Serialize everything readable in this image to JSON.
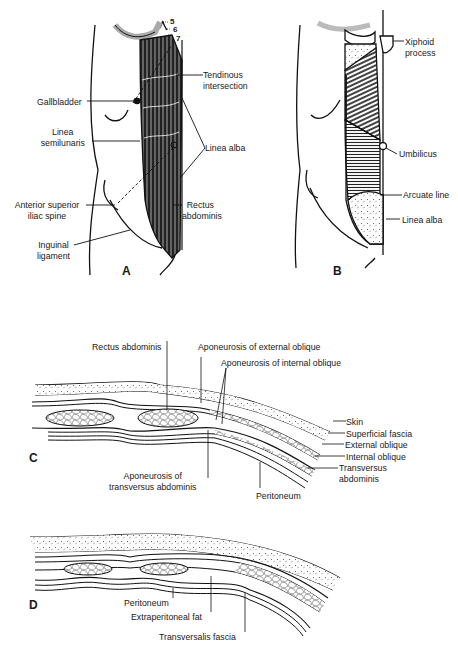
{
  "figure": {
    "panels": {
      "A": {
        "letter": "A",
        "rib_numbers": [
          "5",
          "6",
          "7"
        ],
        "labels": {
          "tendinous_intersection": [
            "Tendinous",
            "intersection"
          ],
          "gallbladder": "Gallbladder",
          "linea_semilunaris": [
            "Linea",
            "semilunaris"
          ],
          "linea_alba": "Linea alba",
          "asis": [
            "Anterior superior",
            "iliac spine"
          ],
          "rectus_abdominis": [
            "Rectus",
            "abdominis"
          ],
          "inguinal_ligament": [
            "Inguinal",
            "ligament"
          ]
        }
      },
      "B": {
        "letter": "B",
        "rib_numbers": [
          "5",
          "6",
          "7",
          "8"
        ],
        "labels": {
          "xiphoid": [
            "Xiphoid",
            "process"
          ],
          "umbilicus": "Umbilicus",
          "arcuate_line": "Arcuate line",
          "linea_alba": "Linea alba"
        }
      },
      "C": {
        "letter": "C",
        "labels": {
          "rectus_abdominis": "Rectus abdominis",
          "apo_external": "Aponeurosis of external oblique",
          "apo_internal": "Aponeurosis of internal oblique",
          "skin": "Skin",
          "superficial_fascia": "Superficial fascia",
          "external_oblique": "External oblique",
          "internal_oblique": "Internal oblique",
          "transversus": [
            "Transversus",
            "abdominis"
          ],
          "apo_transversus": [
            "Aponeurosis of",
            "transversus abdominis"
          ],
          "peritoneum": "Peritoneum"
        }
      },
      "D": {
        "letter": "D",
        "labels": {
          "peritoneum": "Peritoneum",
          "extraperitoneal_fat": "Extraperitoneal fat",
          "transversalis_fascia": "Transversalis fascia"
        }
      }
    }
  }
}
